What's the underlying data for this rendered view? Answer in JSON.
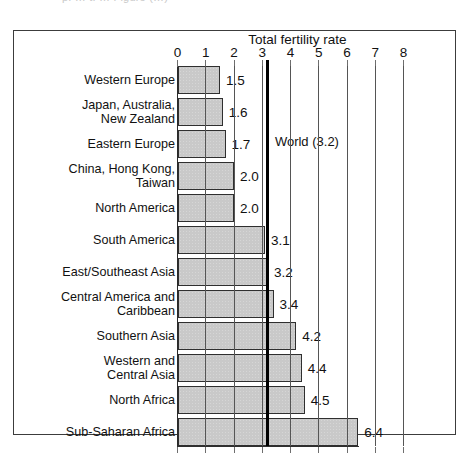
{
  "topbleed": {
    "text": "p. …  t. …  Figure  (…)"
  },
  "figure": {
    "frame_label": "chart-frame"
  },
  "chart_data": {
    "type": "bar",
    "orientation": "horizontal",
    "title": "Total fertility rate",
    "xlabel": "Total fertility rate",
    "ylabel": "",
    "xlim": [
      0,
      8
    ],
    "xticks": [
      0,
      1,
      2,
      3,
      4,
      5,
      6,
      7,
      8
    ],
    "xticklabels": [
      "0",
      "1",
      "2",
      "3",
      "4",
      "5",
      "6",
      "7",
      "8"
    ],
    "grid": true,
    "legend": false,
    "categories": [
      "Western Europe",
      "Japan, Australia,\nNew Zealand",
      "Eastern Europe",
      "China, Hong Kong,\nTaiwan",
      "North America",
      "South America",
      "East/Southeast Asia",
      "Central America and\nCaribbean",
      "Southern Asia",
      "Western and\nCentral Asia",
      "North Africa",
      "Sub-Saharan Africa"
    ],
    "values": [
      1.5,
      1.6,
      1.7,
      2.0,
      2.0,
      3.1,
      3.2,
      3.4,
      4.2,
      4.4,
      4.5,
      6.4
    ],
    "value_labels": [
      "1.5",
      "1.6",
      "1.7",
      "2.0",
      "2.0",
      "3.1",
      "3.2",
      "3.4",
      "4.2",
      "4.4",
      "4.5",
      "6.4"
    ],
    "annotations": [
      {
        "name": "world-reference-line",
        "label": "World (3.2)",
        "value": 3.2
      }
    ],
    "bar_color": "#c9c9c9",
    "bar_edge_color": "#2f2f2f",
    "reference_line_color": "#000000"
  }
}
